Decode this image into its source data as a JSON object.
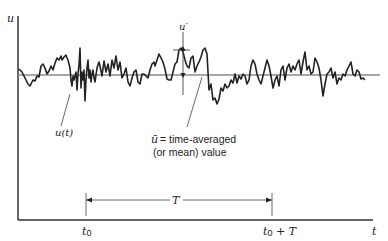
{
  "figure": {
    "y_axis_label": "u",
    "x_axis_label": "t",
    "signal_label": "u(t)",
    "fluctuation_label": "u′",
    "mean_label_symbol": "ū",
    "mean_label_line1": "= time-averaged",
    "mean_label_line2": "(or mean) value",
    "interval_label": "T",
    "t0_label": "t",
    "t0_sub": "0",
    "t0T_label": "t",
    "t0T_sub": "0",
    "t0T_suffix": " + T",
    "colors": {
      "axis": "#333333",
      "signal": "#222222",
      "mean_line": "#8a8a8a",
      "annotation": "#444444"
    }
  }
}
